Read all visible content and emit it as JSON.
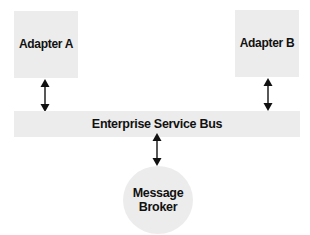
{
  "diagram": {
    "type": "architecture",
    "nodes": {
      "adapter_a": {
        "label": "Adapter A",
        "shape": "rectangle"
      },
      "adapter_b": {
        "label": "Adapter B",
        "shape": "rectangle"
      },
      "bus": {
        "label": "Enterprise Service Bus",
        "shape": "bar"
      },
      "broker": {
        "label_line1": "Message",
        "label_line2": "Broker",
        "shape": "circle"
      }
    },
    "edges": [
      {
        "from": "Adapter A",
        "to": "Enterprise Service Bus",
        "direction": "bidirectional"
      },
      {
        "from": "Adapter B",
        "to": "Enterprise Service Bus",
        "direction": "bidirectional"
      },
      {
        "from": "Enterprise Service Bus",
        "to": "Message Broker",
        "direction": "bidirectional"
      }
    ],
    "colors": {
      "node_fill": "#ececec",
      "text": "#111111",
      "arrow": "#111111",
      "background": "#ffffff"
    }
  }
}
